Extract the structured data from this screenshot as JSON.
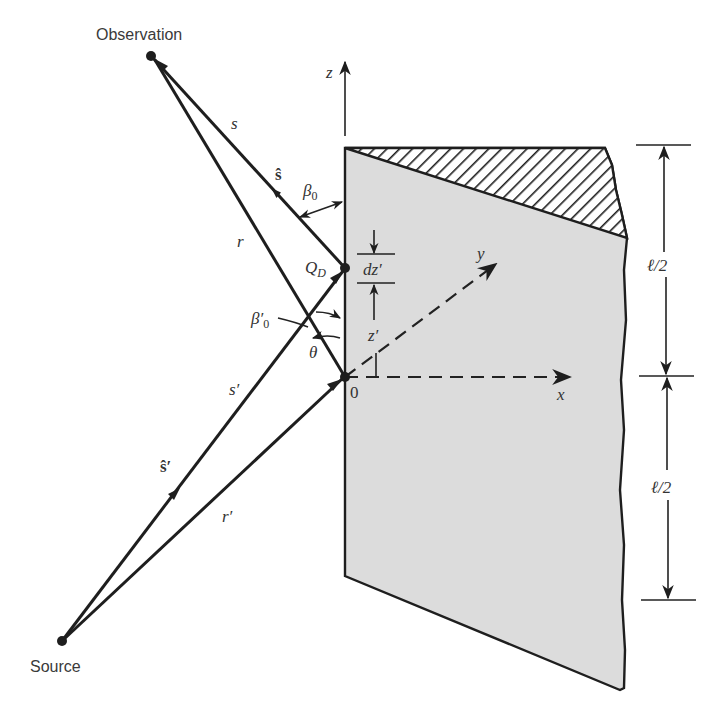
{
  "diagram": {
    "points": {
      "observation": "Observation",
      "source": "Source",
      "qd": "Q",
      "qd_sub": "D",
      "origin": "0"
    },
    "vectors": {
      "s": "s",
      "s_hat": "ŝ",
      "r": "r",
      "s_prime": "s′",
      "s_hat_prime": "ŝ′",
      "r_prime": "r′"
    },
    "angles": {
      "beta0": "β",
      "beta0_sub": "0",
      "beta0_prime": "β′",
      "beta0_prime_sub": "0",
      "theta": "θ"
    },
    "axes": {
      "x": "x",
      "y": "y",
      "z": "z"
    },
    "dimensions": {
      "dz_prime": "dz′",
      "z_prime": "z′",
      "upper_half": "ℓ/2",
      "lower_half": "ℓ/2"
    },
    "colors": {
      "plate_fill": "#dcdcdc",
      "line": "#1e1e1e",
      "background": "#ffffff"
    }
  }
}
